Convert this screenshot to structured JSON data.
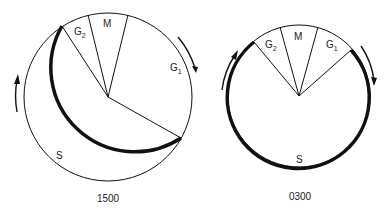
{
  "diagrams": [
    {
      "caption": "1500",
      "phases": {
        "g2": {
          "main": "G",
          "sub": "2"
        },
        "m": {
          "main": "M"
        },
        "g1": {
          "main": "G",
          "sub": "1"
        },
        "s": {
          "main": "S"
        }
      }
    },
    {
      "caption": "0300",
      "phases": {
        "g2": {
          "main": "G",
          "sub": "2"
        },
        "m": {
          "main": "M"
        },
        "g1": {
          "main": "G",
          "sub": "1"
        },
        "s": {
          "main": "S"
        }
      }
    }
  ],
  "colors": {
    "stroke": "#111111",
    "background": "#ffffff"
  }
}
